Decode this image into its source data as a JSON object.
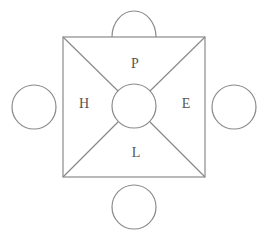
{
  "diagram": {
    "labels": {
      "top": "P",
      "left": "H",
      "right": "E",
      "bottom": "L"
    },
    "colors": {
      "line": "#8a8a8a",
      "text": "#555555",
      "background": "#ffffff"
    }
  }
}
